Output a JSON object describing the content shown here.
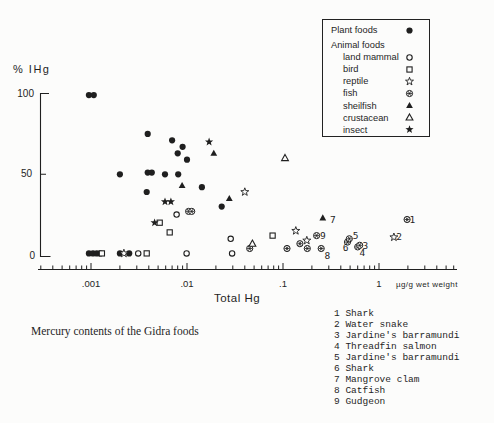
{
  "figure": {
    "y_axis_label": "% IHg",
    "x_axis_title": "Total Hg",
    "x_unit_label": "µg/g wet weight",
    "y_ticks": [
      {
        "value": 100,
        "label": "100"
      },
      {
        "value": 50,
        "label": "50"
      },
      {
        "value": 0,
        "label": "0"
      }
    ],
    "x_ticks": [
      {
        "value": 0.001,
        "label": ".001"
      },
      {
        "value": 0.01,
        "label": ".01"
      },
      {
        "value": 0.1,
        "label": ".1"
      },
      {
        "value": 1,
        "label": "1"
      }
    ]
  },
  "legend": {
    "rows": [
      {
        "label": "Plant foods",
        "symbol": "plant",
        "indent": 0,
        "gap_after": true
      },
      {
        "label": "Animal foods",
        "symbol": null,
        "indent": 0,
        "gap_after": false
      },
      {
        "label": "land mammal",
        "symbol": "land_mammal",
        "indent": 1,
        "gap_after": false
      },
      {
        "label": "bird",
        "symbol": "bird",
        "indent": 1,
        "gap_after": false
      },
      {
        "label": "reptile",
        "symbol": "reptile",
        "indent": 1,
        "gap_after": false
      },
      {
        "label": "fish",
        "symbol": "fish",
        "indent": 1,
        "gap_after": false
      },
      {
        "label": "sheilfish",
        "symbol": "shellfish",
        "indent": 1,
        "gap_after": false
      },
      {
        "label": "crustacean",
        "symbol": "crustacean",
        "indent": 1,
        "gap_after": false
      },
      {
        "label": "insect",
        "symbol": "insect",
        "indent": 1,
        "gap_after": false
      }
    ]
  },
  "caption": "Mercury contents of the Gidra foods",
  "food_list": [
    {
      "num": "1",
      "name": "Shark"
    },
    {
      "num": "2",
      "name": "Water snake"
    },
    {
      "num": "3",
      "name": "Jardine's barramundi"
    },
    {
      "num": "4",
      "name": "Threadfin salmon"
    },
    {
      "num": "5",
      "name": "Jardine's barramundi"
    },
    {
      "num": "6",
      "name": "Shark"
    },
    {
      "num": "7",
      "name": "Mangrove clam"
    },
    {
      "num": "8",
      "name": "Catfish"
    },
    {
      "num": "9",
      "name": "Gudgeon"
    }
  ],
  "chart_data": {
    "type": "scatter",
    "title": "Mercury contents of the Gidra foods",
    "xlabel": "Total Hg",
    "ylabel": "% IHg",
    "x_unit": "µg/g wet weight",
    "x_scale": "log",
    "xlim": [
      0.0003,
      6
    ],
    "ylim": [
      0,
      100
    ],
    "grid": false,
    "legend_position": "top-right",
    "series": [
      {
        "name": "Plant foods",
        "symbol": "plant",
        "points": [
          [
            0.00095,
            99
          ],
          [
            0.00107,
            99
          ],
          [
            0.0039,
            75
          ],
          [
            0.007,
            71
          ],
          [
            0.009,
            67
          ],
          [
            0.008,
            63
          ],
          [
            0.01,
            59
          ],
          [
            0.002,
            50
          ],
          [
            0.0039,
            51
          ],
          [
            0.0043,
            51
          ],
          [
            0.0059,
            50
          ],
          [
            0.0081,
            50
          ],
          [
            0.0143,
            42
          ],
          [
            0.0038,
            39
          ],
          [
            0.023,
            30
          ],
          [
            0.00095,
            1
          ],
          [
            0.00105,
            1
          ],
          [
            0.00115,
            1
          ],
          [
            0.00125,
            1
          ],
          [
            0.002,
            1
          ],
          [
            0.0025,
            1
          ]
        ]
      },
      {
        "name": "land mammal",
        "symbol": "land_mammal",
        "points": [
          [
            0.0078,
            25
          ],
          [
            0.0285,
            10
          ],
          [
            0.0031,
            1
          ],
          [
            0.0099,
            1
          ],
          [
            0.0295,
            1
          ]
        ]
      },
      {
        "name": "bird",
        "symbol": "bird",
        "points": [
          [
            0.0052,
            20
          ],
          [
            0.0066,
            14
          ],
          [
            0.078,
            12
          ],
          [
            0.0013,
            1
          ],
          [
            0.0038,
            1
          ]
        ]
      },
      {
        "name": "reptile",
        "symbol": "reptile",
        "points": [
          [
            0.04,
            39
          ],
          [
            0.136,
            15
          ],
          [
            0.177,
            9
          ],
          [
            1.43,
            11
          ],
          [
            0.0022,
            1
          ]
        ]
      },
      {
        "name": "fish",
        "symbol": "fish",
        "points": [
          [
            0.0104,
            27
          ],
          [
            0.0112,
            27
          ],
          [
            0.045,
            4
          ],
          [
            0.11,
            4
          ],
          [
            0.15,
            7
          ],
          [
            0.179,
            4
          ],
          [
            0.224,
            12
          ],
          [
            0.25,
            4
          ],
          [
            0.47,
            8
          ],
          [
            0.49,
            10
          ],
          [
            0.6,
            5
          ],
          [
            0.63,
            6
          ],
          [
            1.96,
            22
          ]
        ]
      },
      {
        "name": "sheilfish",
        "symbol": "shellfish",
        "points": [
          [
            0.019,
            63
          ],
          [
            0.0089,
            43
          ],
          [
            0.0276,
            35
          ],
          [
            0.26,
            23
          ]
        ]
      },
      {
        "name": "crustacean",
        "symbol": "crustacean",
        "points": [
          [
            0.105,
            60
          ],
          [
            0.048,
            7
          ]
        ]
      },
      {
        "name": "insect",
        "symbol": "insect",
        "points": [
          [
            0.017,
            70
          ],
          [
            0.0059,
            33
          ],
          [
            0.0068,
            33
          ],
          [
            0.0046,
            20
          ]
        ]
      }
    ],
    "point_labels": [
      {
        "text": "1",
        "x": 2.23,
        "y": 22
      },
      {
        "text": "2",
        "x": 1.62,
        "y": 11
      },
      {
        "text": "3",
        "x": 0.72,
        "y": 6
      },
      {
        "text": "4",
        "x": 0.67,
        "y": 1.5
      },
      {
        "text": "5",
        "x": 0.57,
        "y": 12
      },
      {
        "text": "6",
        "x": 0.45,
        "y": 4.5
      },
      {
        "text": "7",
        "x": 0.33,
        "y": 22
      },
      {
        "text": "8",
        "x": 0.29,
        "y": -0.5
      },
      {
        "text": "9",
        "x": 0.26,
        "y": 12
      }
    ]
  }
}
